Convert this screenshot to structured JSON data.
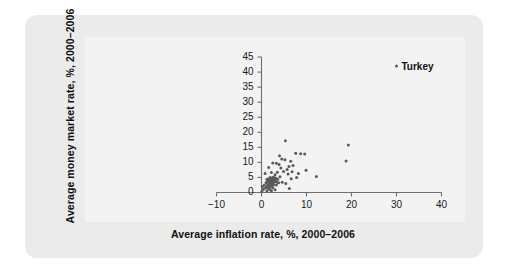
{
  "figure": {
    "card_background": "#ebebeb",
    "plot_background": "#f3f3f3",
    "axis_color": "#6e6e6e",
    "point_color": "#5a5a5a"
  },
  "chart_data": {
    "type": "scatter",
    "title": "",
    "xlabel": "Average inflation rate, %, 2000–2006",
    "ylabel": "Average money market rate, %, 2000–2006",
    "xlim": [
      -13,
      43
    ],
    "ylim": [
      -1.5,
      47
    ],
    "xticks": [
      -10,
      0,
      10,
      20,
      30,
      40
    ],
    "xtick_labels": [
      "−10",
      "0",
      "10",
      "20",
      "30",
      "40"
    ],
    "yticks": [
      0,
      5,
      10,
      15,
      20,
      25,
      30,
      35,
      40,
      45
    ],
    "ytick_labels": [
      "0",
      "5",
      "10",
      "15",
      "20",
      "25",
      "30",
      "35",
      "40",
      "45"
    ],
    "grid": false,
    "legend": null,
    "annotations": [
      {
        "label": "Turkey",
        "x": 30.0,
        "y": 42.0
      }
    ],
    "points": [
      {
        "x": 30.0,
        "y": 42.0
      },
      {
        "x": 5.3,
        "y": 17.2
      },
      {
        "x": 19.3,
        "y": 15.8
      },
      {
        "x": 7.6,
        "y": 13.0
      },
      {
        "x": 8.7,
        "y": 12.9
      },
      {
        "x": 9.6,
        "y": 12.8
      },
      {
        "x": 18.8,
        "y": 10.5
      },
      {
        "x": 4.5,
        "y": 11.1
      },
      {
        "x": 5.2,
        "y": 10.9
      },
      {
        "x": 6.5,
        "y": 10.4
      },
      {
        "x": 2.5,
        "y": 9.8
      },
      {
        "x": 3.3,
        "y": 9.7
      },
      {
        "x": 3.9,
        "y": 9.3
      },
      {
        "x": 6.1,
        "y": 8.6
      },
      {
        "x": 7.0,
        "y": 9.0
      },
      {
        "x": 1.6,
        "y": 8.3
      },
      {
        "x": 4.3,
        "y": 8.1
      },
      {
        "x": 5.7,
        "y": 7.6
      },
      {
        "x": 4.9,
        "y": 7.0
      },
      {
        "x": 6.8,
        "y": 6.9
      },
      {
        "x": 3.5,
        "y": 6.7
      },
      {
        "x": 2.2,
        "y": 6.6
      },
      {
        "x": 0.8,
        "y": 6.3
      },
      {
        "x": 5.9,
        "y": 6.1
      },
      {
        "x": 3.0,
        "y": 5.9
      },
      {
        "x": 12.2,
        "y": 5.3
      },
      {
        "x": 4.1,
        "y": 5.2
      },
      {
        "x": 2.6,
        "y": 5.1
      },
      {
        "x": 1.9,
        "y": 5.0
      },
      {
        "x": 2.9,
        "y": 4.9
      },
      {
        "x": 2.3,
        "y": 4.8
      },
      {
        "x": 3.2,
        "y": 4.7
      },
      {
        "x": 1.5,
        "y": 4.6
      },
      {
        "x": 2.0,
        "y": 4.5
      },
      {
        "x": 2.7,
        "y": 4.4
      },
      {
        "x": 3.6,
        "y": 4.4
      },
      {
        "x": 1.2,
        "y": 4.3
      },
      {
        "x": 2.4,
        "y": 4.2
      },
      {
        "x": 2.8,
        "y": 4.1
      },
      {
        "x": 1.8,
        "y": 4.0
      },
      {
        "x": 2.1,
        "y": 3.9
      },
      {
        "x": 3.1,
        "y": 3.9
      },
      {
        "x": 2.5,
        "y": 3.8
      },
      {
        "x": 1.4,
        "y": 3.7
      },
      {
        "x": 2.2,
        "y": 3.6
      },
      {
        "x": 2.9,
        "y": 3.5
      },
      {
        "x": 1.7,
        "y": 3.4
      },
      {
        "x": 2.6,
        "y": 3.3
      },
      {
        "x": 3.4,
        "y": 3.5
      },
      {
        "x": 1.0,
        "y": 3.2
      },
      {
        "x": 2.0,
        "y": 3.1
      },
      {
        "x": 2.4,
        "y": 3.0
      },
      {
        "x": 3.8,
        "y": 3.2
      },
      {
        "x": 4.6,
        "y": 3.4
      },
      {
        "x": 5.4,
        "y": 3.0
      },
      {
        "x": 1.3,
        "y": 2.8
      },
      {
        "x": 2.1,
        "y": 2.7
      },
      {
        "x": 2.7,
        "y": 2.6
      },
      {
        "x": 3.3,
        "y": 2.5
      },
      {
        "x": 0.6,
        "y": 2.4
      },
      {
        "x": 1.6,
        "y": 2.3
      },
      {
        "x": 2.3,
        "y": 2.2
      },
      {
        "x": 0.2,
        "y": 2.0
      },
      {
        "x": 1.1,
        "y": 1.9
      },
      {
        "x": 1.9,
        "y": 1.8
      },
      {
        "x": 0.9,
        "y": 1.5
      },
      {
        "x": 1.5,
        "y": 1.4
      },
      {
        "x": 2.5,
        "y": 1.6
      },
      {
        "x": 0.4,
        "y": 1.1
      },
      {
        "x": 1.8,
        "y": 1.0
      },
      {
        "x": 6.2,
        "y": 1.3
      },
      {
        "x": 3.0,
        "y": 0.9
      },
      {
        "x": 2.2,
        "y": 0.6
      },
      {
        "x": 1.2,
        "y": 0.5
      },
      {
        "x": 0.1,
        "y": 0.3
      },
      {
        "x": 9.9,
        "y": 7.4
      },
      {
        "x": 8.2,
        "y": 6.3
      },
      {
        "x": 4.0,
        "y": 12.2
      },
      {
        "x": 6.6,
        "y": 4.6
      },
      {
        "x": 7.8,
        "y": 5.0
      }
    ]
  }
}
